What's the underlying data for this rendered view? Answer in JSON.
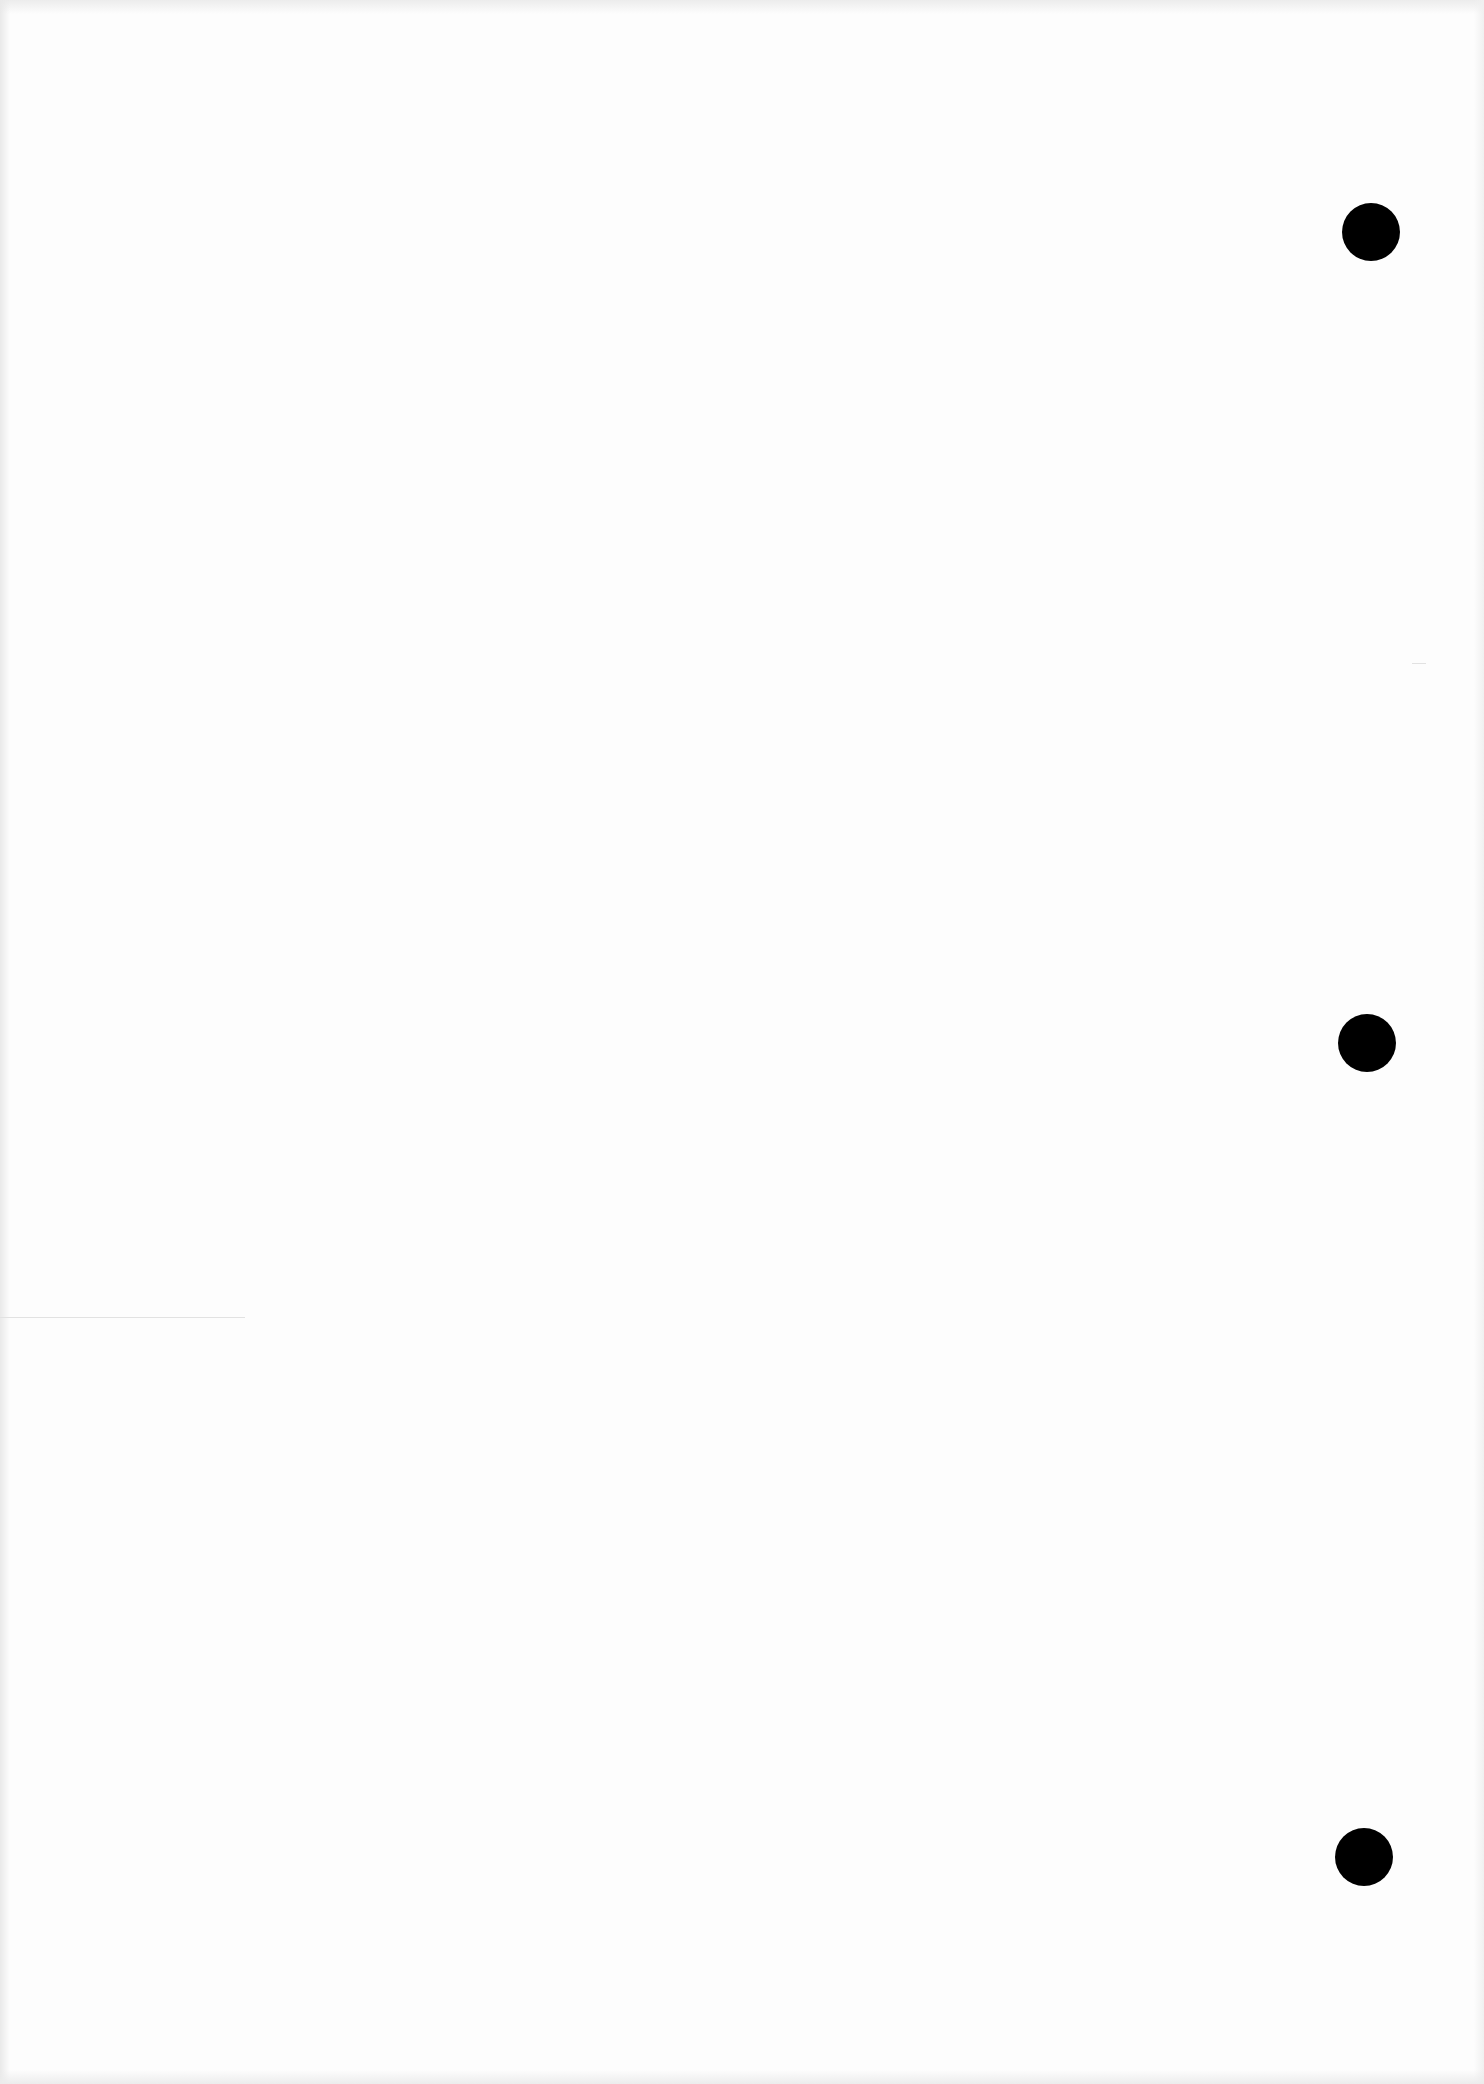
{
  "document": {
    "type": "blank-scanned-page",
    "paper_color": "#fdfdfd",
    "text_content": []
  },
  "punch_holes": [
    {
      "cx": 1371,
      "cy": 232,
      "diameter": 58,
      "color": "#000000"
    },
    {
      "cx": 1367,
      "cy": 1043,
      "diameter": 58,
      "color": "#000000"
    },
    {
      "cx": 1364,
      "cy": 1857,
      "diameter": 58,
      "color": "#000000"
    }
  ],
  "scan_artifacts": [
    {
      "x": 0,
      "y": 1317,
      "width": 245
    },
    {
      "x": 1412,
      "y": 663,
      "width": 14
    }
  ]
}
